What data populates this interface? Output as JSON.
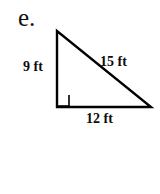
{
  "figure": {
    "problem_label": "e.",
    "shape": "right-triangle",
    "stroke_color": "#000000",
    "background_color": "#ffffff",
    "unit": "ft",
    "vertices": {
      "apex": [
        57,
        31
      ],
      "right_angle": [
        57,
        107
      ],
      "right": [
        151,
        107
      ]
    },
    "right_angle_marker": {
      "present": true,
      "at": "right_angle",
      "size": 11
    },
    "sides": [
      {
        "name": "leg-vertical",
        "label": "9 ft",
        "value": 9,
        "unit": "ft"
      },
      {
        "name": "hypotenuse",
        "label": "15 ft",
        "value": 15,
        "unit": "ft"
      },
      {
        "name": "leg-horizontal",
        "label": "12 ft",
        "value": 12,
        "unit": "ft"
      }
    ]
  }
}
